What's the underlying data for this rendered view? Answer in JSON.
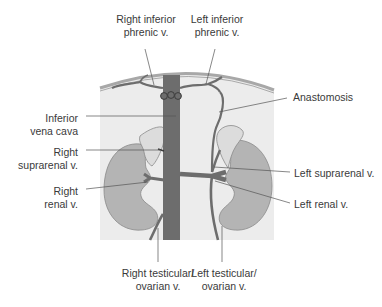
{
  "colors": {
    "background": "#ffffff",
    "abdomen_fill": "#ececec",
    "diaphragm": "#a8a8a8",
    "vein": "#6d6d6d",
    "kidney": "#b4b4b4",
    "adrenal": "#dcdcdc",
    "leader_line": "#555555",
    "text": "#3a3a3a"
  },
  "labels": {
    "right_inferior_phrenic": "Right inferior\nphrenic v.",
    "left_inferior_phrenic": "Left inferior\nphrenic v.",
    "anastomosis": "Anastomosis",
    "inferior_vena_cava": "Inferior\nvena cava",
    "right_suprarenal": "Right\nsuprarenal v.",
    "right_renal": "Right\nrenal v.",
    "left_suprarenal": "Left suprarenal v.",
    "left_renal": "Left renal v.",
    "right_testicular": "Right testicular/\novarian v.",
    "left_testicular": "Left testicular/\novarian v."
  }
}
